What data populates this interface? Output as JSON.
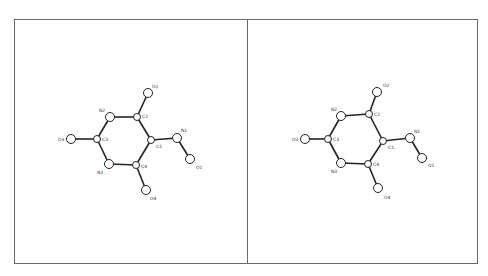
{
  "figure": {
    "type": "stereo-pair molecular structure diagram",
    "panels": [
      {
        "name": "left",
        "atoms": [
          {
            "id": "O2",
            "x": 148,
            "y": 93,
            "r": 4.5,
            "lx": 152,
            "ly": 88
          },
          {
            "id": "C2",
            "x": 137,
            "y": 117,
            "r": 3.5,
            "lx": 142,
            "ly": 118
          },
          {
            "id": "N2",
            "x": 110,
            "y": 117,
            "r": 4.5,
            "lx": 99,
            "ly": 112
          },
          {
            "id": "C3",
            "x": 97,
            "y": 139,
            "r": 3.5,
            "lx": 102,
            "ly": 141
          },
          {
            "id": "O3",
            "x": 71,
            "y": 139,
            "r": 4.5,
            "lx": 58,
            "ly": 141
          },
          {
            "id": "N3",
            "x": 109,
            "y": 164,
            "r": 4.5,
            "lx": 97,
            "ly": 174
          },
          {
            "id": "C4",
            "x": 136,
            "y": 165,
            "r": 3.5,
            "lx": 141,
            "ly": 168
          },
          {
            "id": "O4",
            "x": 146,
            "y": 190,
            "r": 4.5,
            "lx": 150,
            "ly": 200
          },
          {
            "id": "C1",
            "x": 151,
            "y": 140,
            "r": 3.5,
            "lx": 156,
            "ly": 148
          },
          {
            "id": "N1",
            "x": 177,
            "y": 138,
            "r": 4.5,
            "lx": 181,
            "ly": 132
          },
          {
            "id": "O1",
            "x": 190,
            "y": 159,
            "r": 4.5,
            "lx": 196,
            "ly": 169
          }
        ]
      },
      {
        "name": "right",
        "atoms": [
          {
            "id": "O2",
            "x": 377,
            "y": 92,
            "r": 4.5,
            "lx": 383,
            "ly": 87
          },
          {
            "id": "C2",
            "x": 369,
            "y": 114,
            "r": 3.5,
            "lx": 374,
            "ly": 116
          },
          {
            "id": "N2",
            "x": 341,
            "y": 116,
            "r": 4.5,
            "lx": 331,
            "ly": 111
          },
          {
            "id": "C3",
            "x": 328,
            "y": 139,
            "r": 3.5,
            "lx": 333,
            "ly": 141
          },
          {
            "id": "O3",
            "x": 305,
            "y": 139,
            "r": 4.5,
            "lx": 292,
            "ly": 141
          },
          {
            "id": "N3",
            "x": 341,
            "y": 163,
            "r": 4.5,
            "lx": 331,
            "ly": 173
          },
          {
            "id": "C4",
            "x": 368,
            "y": 164,
            "r": 3.5,
            "lx": 373,
            "ly": 166
          },
          {
            "id": "O4",
            "x": 378,
            "y": 188,
            "r": 4.5,
            "lx": 384,
            "ly": 199
          },
          {
            "id": "C1",
            "x": 383,
            "y": 141,
            "r": 3.5,
            "lx": 388,
            "ly": 149
          },
          {
            "id": "N1",
            "x": 410,
            "y": 138,
            "r": 4.5,
            "lx": 414,
            "ly": 133
          },
          {
            "id": "O1",
            "x": 422,
            "y": 158,
            "r": 4.5,
            "lx": 428,
            "ly": 167
          }
        ]
      }
    ],
    "bonds": [
      [
        "O2",
        "C2"
      ],
      [
        "C2",
        "N2"
      ],
      [
        "N2",
        "C3"
      ],
      [
        "C3",
        "O3"
      ],
      [
        "C3",
        "N3"
      ],
      [
        "N3",
        "C4"
      ],
      [
        "C4",
        "O4"
      ],
      [
        "C4",
        "C1"
      ],
      [
        "C1",
        "C2"
      ],
      [
        "C1",
        "N1"
      ],
      [
        "N1",
        "O1"
      ]
    ]
  }
}
